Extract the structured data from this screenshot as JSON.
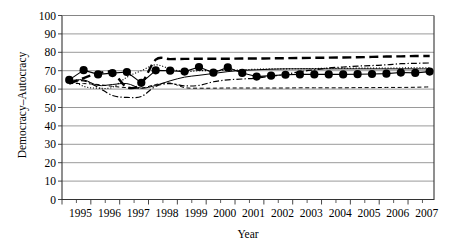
{
  "chart_data": {
    "type": "line",
    "title": "",
    "xlabel": "Year",
    "ylabel": "Democracy–Autocracy",
    "xlim": [
      1995,
      2007.9
    ],
    "ylim": [
      0,
      100
    ],
    "ytick_step": 10,
    "yticks": [
      0,
      10,
      20,
      30,
      40,
      50,
      60,
      70,
      80,
      90,
      100
    ],
    "xticks": [
      1995,
      1996,
      1997,
      1998,
      1999,
      2000,
      2001,
      2002,
      2003,
      2004,
      2005,
      2006,
      2007
    ],
    "xminor_ticks_per_interval": 2,
    "grid": "horizontal",
    "legend": "none",
    "x": [
      1995.25,
      1995.75,
      1996.25,
      1996.75,
      1997.25,
      1997.75,
      1998.25,
      1998.75,
      1999.25,
      1999.75,
      2000.25,
      2000.75,
      2001.25,
      2001.75,
      2002.25,
      2002.75,
      2003.25,
      2003.75,
      2004.25,
      2004.75,
      2005.25,
      2005.75,
      2006.25,
      2006.75,
      2007.25,
      2007.75
    ],
    "series": [
      {
        "name": "series-markers-solid",
        "style": "solid-thin-with-filled-circle-markers",
        "marker": "filled-circle",
        "linewidth": 1.1,
        "values": [
          65.0,
          70.3,
          68.0,
          68.7,
          69.3,
          63.4,
          70.2,
          70.0,
          69.5,
          72.0,
          68.9,
          71.8,
          68.8,
          66.8,
          67.3,
          67.8,
          68.0,
          68.0,
          68.0,
          68.0,
          68.1,
          68.2,
          68.4,
          69.0,
          68.8,
          69.5
        ]
      },
      {
        "name": "series-thick-dashed",
        "style": "thick-dashed",
        "marker": "none",
        "linewidth": 2.4,
        "values": [
          63.0,
          66.0,
          68.5,
          69.0,
          61.0,
          63.0,
          76.0,
          76.3,
          76.4,
          76.5,
          76.5,
          76.5,
          76.6,
          76.6,
          76.7,
          76.8,
          76.9,
          77.0,
          77.1,
          77.2,
          77.3,
          77.5,
          77.7,
          77.8,
          78.0,
          78.0
        ]
      },
      {
        "name": "series-dash-dot",
        "style": "dash-dot",
        "marker": "none",
        "linewidth": 1.2,
        "values": [
          64.0,
          64.5,
          61.0,
          56.5,
          55.5,
          56.0,
          61.5,
          63.0,
          61.8,
          62.0,
          64.0,
          65.0,
          65.5,
          66.0,
          67.0,
          68.0,
          69.5,
          70.5,
          71.5,
          72.0,
          72.5,
          72.8,
          73.2,
          73.8,
          74.0,
          74.2
        ]
      },
      {
        "name": "series-dotted",
        "style": "dotted",
        "marker": "none",
        "linewidth": 1.0,
        "values": [
          66.0,
          61.5,
          60.5,
          61.0,
          66.5,
          70.0,
          73.2,
          71.0,
          69.5,
          70.0,
          70.0,
          70.2,
          70.5,
          70.8,
          71.0,
          71.0,
          71.1,
          71.2,
          71.3,
          71.3,
          71.4,
          71.4,
          71.5,
          71.5,
          71.6,
          71.6
        ]
      },
      {
        "name": "series-solid-thin",
        "style": "solid-thin",
        "marker": "none",
        "linewidth": 1.0,
        "values": [
          64.5,
          65.0,
          62.0,
          62.5,
          63.0,
          60.5,
          62.0,
          64.5,
          66.5,
          67.5,
          68.5,
          69.5,
          70.2,
          70.5,
          70.8,
          71.0,
          71.0,
          71.0,
          71.0,
          71.0,
          71.0,
          71.0,
          71.0,
          71.0,
          71.0,
          71.0
        ]
      },
      {
        "name": "series-thin-dashed-low",
        "style": "thin-dashed",
        "marker": "none",
        "linewidth": 1.0,
        "values": [
          63.0,
          63.0,
          62.5,
          61.5,
          60.8,
          60.5,
          62.5,
          63.3,
          60.8,
          60.5,
          60.5,
          60.6,
          60.6,
          60.6,
          60.6,
          60.6,
          60.7,
          60.7,
          60.7,
          60.7,
          60.8,
          60.8,
          60.9,
          60.9,
          61.0,
          61.2
        ]
      }
    ]
  },
  "axis": {
    "y_title": "Democracy–Autocracy",
    "x_title": "Year",
    "y_labels": [
      "100",
      "90",
      "80",
      "70",
      "60",
      "50",
      "40",
      "30",
      "20",
      "10",
      "0"
    ],
    "x_labels": [
      "1995",
      "1996",
      "1997",
      "1998",
      "1999",
      "2000",
      "2001",
      "2002",
      "2003",
      "2004",
      "2005",
      "2006",
      "2007"
    ]
  },
  "colors": {
    "line": "#000000",
    "grid": "#808080",
    "axis": "#404040",
    "background": "#ffffff"
  }
}
